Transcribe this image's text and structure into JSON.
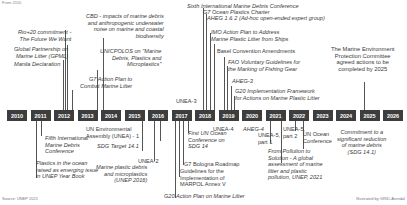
{
  "caption": "From 2010",
  "years": [
    "2010",
    "2011",
    "2012",
    "2013",
    "2014",
    "2015",
    "2016",
    "2017",
    "2018",
    "2019",
    "2020",
    "2021",
    "2022",
    "2023",
    "2024",
    "2025",
    "2026"
  ],
  "events_above": {
    "rio20": "Rio+20 commitment -\nThe Future We Want",
    "gpml": "Global Partnership on\nMarine Litter (GPML)",
    "manila": "Manila Declaration",
    "cbd": "CBD - impacts of marine debris\nand anthropogenic underwater\nnoise on marine and coastal\nbiodiversity",
    "unicpolos": "UNICPOLOS on \"Marine\nDebris, Plastics and\nMicroplastics\"",
    "g7_action": "G7 Action Plan to\nCombat Marine Litter",
    "unea3": "UNEA-3",
    "sixth_conf": "Sixth International Marine Debris Conference",
    "g7_charter": "G7 Ocean Plastics Charter",
    "aheg12": "AHEG 1 & 2 (Ad-hoc open-ended expert group)",
    "imo": "IMO Action Plan to Address\nMarine Plastic Litter from Ships",
    "basel": "Basel Convention Amendments",
    "fao": "FAO Voluntary Guidelines for\nthe Marking of Fishing Gear",
    "aheg3": "AHEG-3",
    "g20_framework": "G20 Implementation Framework\nfor Actions on Marine Plastic Litter",
    "mepc": "The Marine Environment\nProtection Committee\nagreed actions to be\ncompleted by 2025"
  },
  "events_below": {
    "fifth_conf": "Fifth International\nMarine Debris\nConference",
    "unep_yearbook": "Plastics in the ocean\nraised as emerging issue\nin UNEP Year Book",
    "unea1": "UN Environmental\nAssembly (UNEA) - 1",
    "sdg141": "SDG Target 14.1",
    "unea2": "UNEA-2",
    "unep2016": "Marine plastic debris\nand microplastics\n(UNEP 2016)",
    "first_ocean": "First UN Ocean\nConference on\nSDG 14",
    "g7_bologna": "G7 Bologna Roadmap",
    "marpol": "Guidelines for the\nImplementation of\nMARPOL Annex V",
    "g20_action": "G20 Action Plan on Marine Litter",
    "unea4": "UNEA-4",
    "aheg4": "AHEG-4",
    "unea5p1": "UNEA-5,\npart 1",
    "unea5p2": "UNEA-5,\npart 2",
    "un_ocean": "UN Ocean\nConference",
    "pollution_solution": "From Pollution to\nSolution - A global\nassessment of marine\nlitter and plastic\npollution, UNEP, 2021",
    "commitment": "Commitment to a\nsignificant reduction\nof marine debris\n(SDG 14.1)"
  },
  "footer": {
    "source": "Source: UNEP 2021",
    "credit": "Illustrated by GRID-Arendal"
  },
  "colors": {
    "year_box": "#3d3d3d",
    "text": "#3a3a3a",
    "line": "#555555"
  }
}
